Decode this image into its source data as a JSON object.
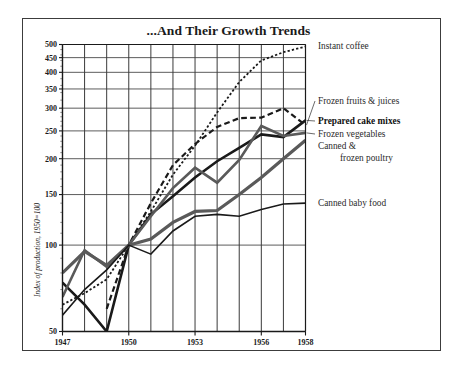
{
  "figure": {
    "title": "...And Their Growth Trends",
    "frame_color": "#3c3c3c",
    "background": "#ffffff"
  },
  "chart_data": {
    "type": "line",
    "title": "...And Their Growth Trends",
    "xlabel": "",
    "ylabel": "Index of production, 1950=100",
    "y_scale": "log",
    "ylim": [
      50,
      500
    ],
    "xlim": [
      1947,
      1958
    ],
    "grid": true,
    "legend_position": "right-inline",
    "x": [
      1947,
      1948,
      1949,
      1950,
      1951,
      1952,
      1953,
      1954,
      1955,
      1956,
      1957,
      1958
    ],
    "xticks": [
      1947,
      1950,
      1953,
      1956,
      1958
    ],
    "xtick_labels": [
      "1947",
      "1950",
      "1953",
      "1956",
      "1958"
    ],
    "yticks": [
      50,
      100,
      150,
      200,
      250,
      300,
      350,
      400,
      450,
      500
    ],
    "ytick_labels": [
      "50",
      "100",
      "150",
      "200",
      "250",
      "300",
      "350",
      "400",
      "450",
      "500"
    ],
    "series": [
      {
        "name": "Instant coffee",
        "style": "dotted",
        "color": "#1a1a1a",
        "width": 1.8,
        "values": [
          62,
          68,
          76,
          100,
          131,
          176,
          222,
          290,
          370,
          440,
          470,
          492
        ]
      },
      {
        "name": "Frozen fruits & juices",
        "style": "dashed",
        "color": "#1a1a1a",
        "width": 2.2,
        "values": [
          null,
          null,
          60,
          100,
          140,
          190,
          225,
          258,
          277,
          278,
          300,
          262
        ]
      },
      {
        "name": "Prepared cake mixes",
        "style": "solid",
        "color": "#1a1a1a",
        "width": 2.6,
        "values": [
          74,
          62,
          50,
          100,
          128,
          148,
          172,
          196,
          218,
          243,
          238,
          272
        ]
      },
      {
        "name": "Frozen vegetables",
        "style": "solid",
        "color": "#5a5a5a",
        "width": 2.6,
        "values": [
          66,
          96,
          84,
          100,
          126,
          158,
          186,
          165,
          198,
          260,
          240,
          246
        ]
      },
      {
        "name": "Canned & frozen poultry",
        "style": "solid",
        "color": "#5a5a5a",
        "width": 3.2,
        "values": [
          80,
          95,
          85,
          100,
          105,
          120,
          131,
          132,
          150,
          172,
          200,
          232
        ]
      },
      {
        "name": "Canned baby food",
        "style": "solid",
        "color": "#1a1a1a",
        "width": 1.6,
        "values": [
          57,
          70,
          82,
          100,
          93,
          112,
          126,
          128,
          126,
          133,
          139,
          140
        ]
      }
    ],
    "annotations": [
      {
        "label": "Instant coffee",
        "series": "Instant coffee"
      },
      {
        "label": "Frozen fruits & juices",
        "series": "Frozen fruits & juices"
      },
      {
        "label": "Prepared cake mixes",
        "series": "Prepared cake mixes"
      },
      {
        "label": "Frozen vegetables",
        "series": "Frozen vegetables"
      },
      {
        "label": "Canned &",
        "series": "Canned & frozen poultry"
      },
      {
        "label": "frozen poultry",
        "series": "Canned & frozen poultry"
      },
      {
        "label": "Canned baby food",
        "series": "Canned baby food"
      }
    ]
  },
  "legend": {
    "items": [
      {
        "label": "Instant coffee",
        "bold": false
      },
      {
        "label": "Frozen fruits & juices",
        "bold": false
      },
      {
        "label": "Prepared cake mixes",
        "bold": true
      },
      {
        "label": "Frozen vegetables",
        "bold": false
      },
      {
        "label": "Canned &",
        "bold": false
      },
      {
        "label": "frozen poultry",
        "bold": false
      },
      {
        "label": "Canned baby food",
        "bold": false
      }
    ]
  }
}
